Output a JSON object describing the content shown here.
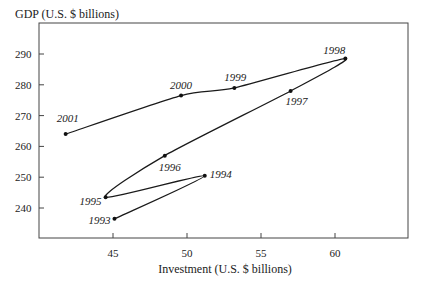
{
  "chart_data": {
    "type": "line",
    "subtype": "connected-scatter",
    "title": "",
    "xlabel": "Investment (U.S. $ billions)",
    "ylabel": "GDP (U.S. $ billions)",
    "xlim": [
      39.5,
      64.5
    ],
    "ylim": [
      231,
      300
    ],
    "xticks": [
      45,
      50,
      55,
      60
    ],
    "yticks": [
      240,
      250,
      260,
      270,
      280,
      290
    ],
    "grid": false,
    "legend": null,
    "series": [
      {
        "name": "GDP vs Investment by year",
        "points": [
          {
            "label": "1993",
            "x": 45.1,
            "y": 236.5
          },
          {
            "label": "1994",
            "x": 51.2,
            "y": 250.5
          },
          {
            "label": "1995",
            "x": 44.5,
            "y": 243.5
          },
          {
            "label": "1996",
            "x": 48.5,
            "y": 257.0
          },
          {
            "label": "1997",
            "x": 57.0,
            "y": 278.0
          },
          {
            "label": "1998",
            "x": 60.7,
            "y": 288.5
          },
          {
            "label": "1999",
            "x": 53.2,
            "y": 279.0
          },
          {
            "label": "2000",
            "x": 49.6,
            "y": 276.5
          },
          {
            "label": "2001",
            "x": 41.8,
            "y": 264.0
          }
        ]
      }
    ],
    "annotations": [
      {
        "text": "1993",
        "x": 45.1,
        "y": 236.5,
        "dx": -26,
        "dy": 5
      },
      {
        "text": "1994",
        "x": 51.2,
        "y": 250.5,
        "dx": 5,
        "dy": 2
      },
      {
        "text": "1995",
        "x": 44.5,
        "y": 243.5,
        "dx": -26,
        "dy": 8
      },
      {
        "text": "1996",
        "x": 48.5,
        "y": 257.0,
        "dx": -6,
        "dy": 15
      },
      {
        "text": "1997",
        "x": 57.0,
        "y": 278.0,
        "dx": -5,
        "dy": 14
      },
      {
        "text": "1998",
        "x": 60.7,
        "y": 288.5,
        "dx": -22,
        "dy": -5
      },
      {
        "text": "1999",
        "x": 53.2,
        "y": 279.0,
        "dx": -10,
        "dy": -7
      },
      {
        "text": "2000",
        "x": 49.6,
        "y": 276.5,
        "dx": -11,
        "dy": -7
      },
      {
        "text": "2001",
        "x": 41.8,
        "y": 264.0,
        "dx": -9,
        "dy": -12
      }
    ]
  },
  "frame": {
    "left": 39,
    "top": 23,
    "right": 408,
    "bottom": 238
  },
  "colors": {
    "line": "#1a1a1a",
    "axis": "#444444",
    "text": "#222222"
  }
}
